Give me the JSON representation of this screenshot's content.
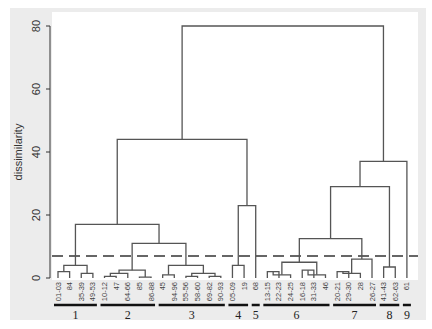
{
  "chart_data": {
    "type": "dendrogram",
    "title": "",
    "ylabel": "dissimilarity",
    "xlabel": "",
    "ylim": [
      0,
      80
    ],
    "yticks": [
      0,
      20,
      40,
      60,
      80
    ],
    "cut_line": 7,
    "leaves": [
      "01-03",
      "84",
      "35-39",
      "49-53",
      "10-12",
      "47",
      "64-66",
      "85",
      "86-88",
      "45",
      "94-96",
      "55-56",
      "58-60",
      "69-82",
      "90-93",
      "05-09",
      "19",
      "68",
      "13-15",
      "22-23",
      "24-25",
      "16-18",
      "31-33",
      "46",
      "20-21",
      "29-30",
      "28",
      "26-27",
      "41-43",
      "62-63",
      "61"
    ],
    "groups": [
      {
        "label": "1",
        "leaves": [
          "01-03",
          "84",
          "35-39",
          "49-53"
        ]
      },
      {
        "label": "2",
        "leaves": [
          "10-12",
          "47",
          "64-66",
          "85",
          "86-88"
        ]
      },
      {
        "label": "3",
        "leaves": [
          "45",
          "94-96",
          "55-56",
          "58-60",
          "69-82",
          "90-93"
        ]
      },
      {
        "label": "4",
        "leaves": [
          "05-09",
          "19"
        ]
      },
      {
        "label": "5",
        "leaves": [
          "68"
        ]
      },
      {
        "label": "6",
        "leaves": [
          "13-15",
          "22-23",
          "24-25",
          "16-18",
          "31-33",
          "46"
        ]
      },
      {
        "label": "7",
        "leaves": [
          "20-21",
          "29-30",
          "28",
          "26-27"
        ]
      },
      {
        "label": "8",
        "leaves": [
          "41-43",
          "62-63"
        ]
      },
      {
        "label": "9",
        "leaves": [
          "61"
        ]
      }
    ],
    "merges": [
      {
        "left": "01-03",
        "right": "84",
        "height": 2
      },
      {
        "left": "35-39",
        "right": "49-53",
        "height": 1.5
      },
      {
        "left": "G1a",
        "right": "G1b",
        "height": 4,
        "id": "G1"
      },
      {
        "left": "10-12",
        "right": "47",
        "height": 0.5
      },
      {
        "left": "G2a",
        "right": "64-66",
        "height": 1.5
      },
      {
        "left": "85",
        "right": "86-88",
        "height": 0.3
      },
      {
        "left": "G2b",
        "right": "G2c",
        "height": 2.5,
        "id": "G2"
      },
      {
        "left": "45",
        "right": "94-96",
        "height": 1
      },
      {
        "left": "55-56",
        "right": "58-60",
        "height": 0.5
      },
      {
        "left": "69-82",
        "right": "90-93",
        "height": 0.5
      },
      {
        "left": "G3b",
        "right": "G3c",
        "height": 1.5
      },
      {
        "left": "G3a",
        "right": "G3d",
        "height": 4,
        "id": "G3"
      },
      {
        "left": "G2",
        "right": "G3",
        "height": 11
      },
      {
        "left": "G1",
        "right": "G23",
        "height": 17
      },
      {
        "left": "05-09",
        "right": "19",
        "height": 4,
        "id": "G4"
      },
      {
        "left": "G4",
        "right": "68",
        "height": 23
      },
      {
        "left": "G123",
        "right": "G45",
        "height": 44
      },
      {
        "left": "13-15",
        "right": "22-23",
        "height": 2
      },
      {
        "left": "G6a",
        "right": "24-25",
        "height": 1
      },
      {
        "left": "16-18",
        "right": "31-33",
        "height": 2.5
      },
      {
        "left": "G6c",
        "right": "46",
        "height": 1
      },
      {
        "left": "G6b",
        "right": "G6d",
        "height": 5,
        "id": "G6"
      },
      {
        "left": "20-21",
        "right": "29-30",
        "height": 2
      },
      {
        "left": "G7a",
        "right": "28",
        "height": 1.5
      },
      {
        "left": "G7b",
        "right": "26-27",
        "height": 6,
        "id": "G7"
      },
      {
        "left": "G6",
        "right": "G7",
        "height": 12.5
      },
      {
        "left": "41-43",
        "right": "62-63",
        "height": 3.5,
        "id": "G8"
      },
      {
        "left": "G67",
        "right": "G8",
        "height": 29
      },
      {
        "left": "G678",
        "right": "61",
        "height": 37
      },
      {
        "left": "G12345",
        "right": "G6789",
        "height": 80
      }
    ],
    "grid": false,
    "colors": {
      "lines": "#555555",
      "cut_line": "#666666",
      "background": "#eaeaea",
      "panel": "#ffffff",
      "group_bar": "#111111"
    }
  }
}
